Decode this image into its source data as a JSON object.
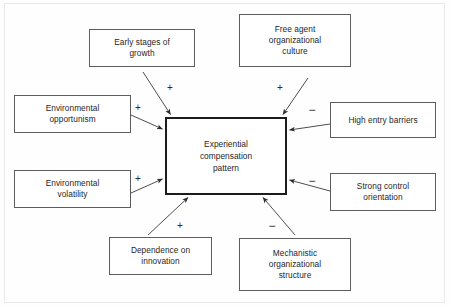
{
  "diagram": {
    "type": "causal-influence-diagram",
    "center": {
      "label": "Experiential\ncompensation\npattern",
      "label_lines": [
        "Experiential",
        "compensation",
        "pattern"
      ]
    },
    "nodes": [
      {
        "id": "early-stages-of-growth",
        "label": "Early stages of\ngrowth",
        "label_lines": [
          "Early stages of",
          "growth"
        ],
        "sign": "+",
        "position": "top-left"
      },
      {
        "id": "free-agent-organizational-culture",
        "label": "Free agent\norganizational\nculture",
        "label_lines": [
          "Free agent",
          "organizational",
          "culture"
        ],
        "sign": "+",
        "position": "top-right"
      },
      {
        "id": "environmental-opportunism",
        "label": "Environmental\nopportunism",
        "label_lines": [
          "Environmental",
          "opportunism"
        ],
        "sign": "+",
        "position": "left-upper"
      },
      {
        "id": "environmental-volatility",
        "label": "Environmental\nvolatility",
        "label_lines": [
          "Environmental",
          "volatility"
        ],
        "sign": "+",
        "position": "left-lower"
      },
      {
        "id": "high-entry-barriers",
        "label": "High entry barriers",
        "label_lines": [
          "High entry barriers"
        ],
        "sign": "−",
        "position": "right-upper"
      },
      {
        "id": "strong-control-orientation",
        "label": "Strong control\norientation",
        "label_lines": [
          "Strong control",
          "orientation"
        ],
        "sign": "−",
        "position": "right-lower"
      },
      {
        "id": "dependence-on-innovation",
        "label": "Dependence on\ninnovation",
        "label_lines": [
          "Dependence on",
          "innovation"
        ],
        "sign": "+",
        "position": "bottom-left"
      },
      {
        "id": "mechanistic-organizational-structure",
        "label": "Mechanistic\norganizational\nstructure",
        "label_lines": [
          "Mechanistic",
          "organizational",
          "structure"
        ],
        "sign": "−",
        "position": "bottom-right"
      }
    ],
    "signs": {
      "early_stages_of_growth": "+",
      "free_agent_organizational_culture": "+",
      "environmental_opportunism": "+",
      "environmental_volatility": "+",
      "high_entry_barriers": "−",
      "strong_control_orientation": "−",
      "dependence_on_innovation": "+",
      "mechanistic_organizational_structure": "−"
    },
    "colors": {
      "box_border": "#5d5d5d",
      "center_border": "#1c1c1c",
      "text": "#262626",
      "arrow": "#3a3a3a",
      "background": "#ffffff",
      "page_frame": "#e9e9e9"
    }
  }
}
